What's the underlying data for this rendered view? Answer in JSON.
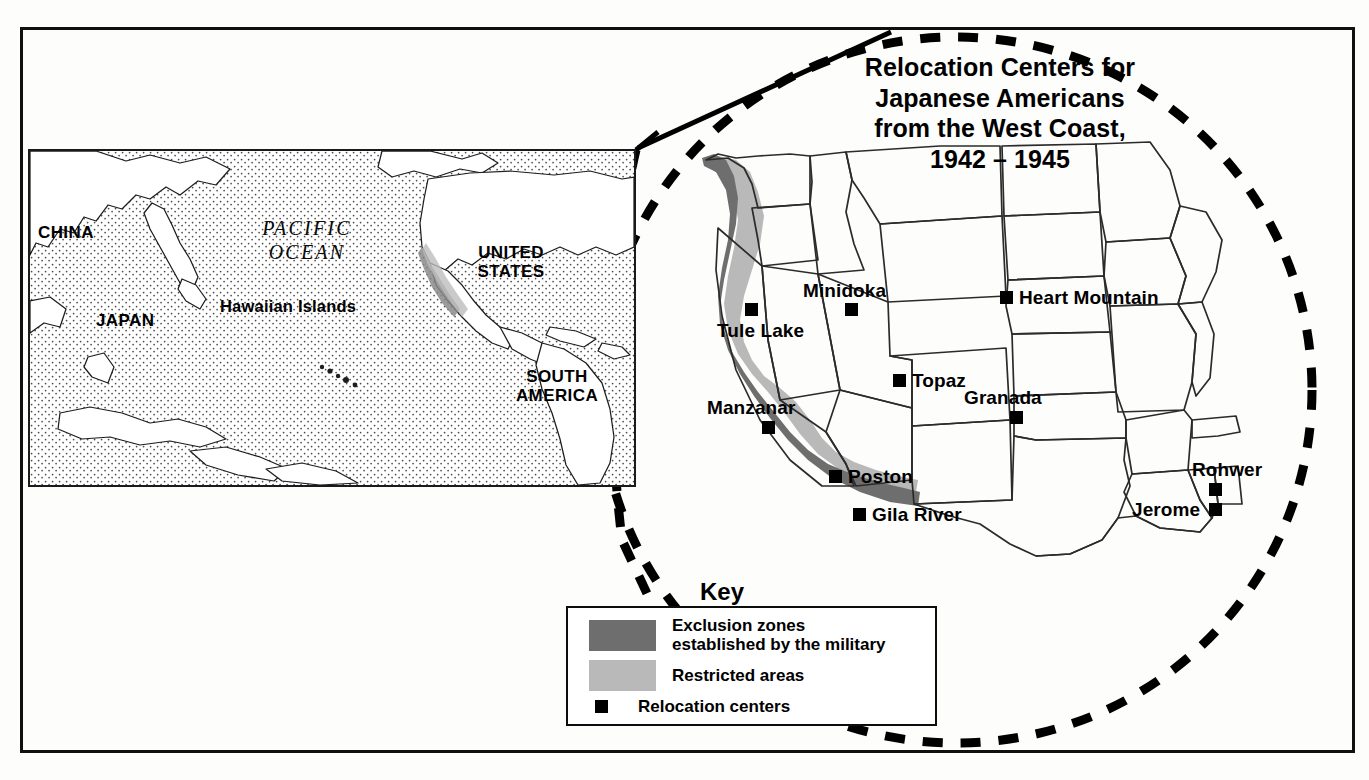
{
  "title": "Relocation Centers for\nJapanese Americans\nfrom the West Coast,\n1942 – 1945",
  "inset": {
    "ocean_label": "PACIFIC\nOCEAN",
    "labels": [
      {
        "name": "china",
        "text": "CHINA"
      },
      {
        "name": "japan",
        "text": "JAPAN"
      },
      {
        "name": "hawaiian-islands",
        "text": "Hawaiian Islands"
      },
      {
        "name": "united-states",
        "text": "UNITED\nSTATES"
      },
      {
        "name": "south-america",
        "text": "SOUTH\nAMERICA"
      }
    ]
  },
  "camps": [
    {
      "name": "tule-lake",
      "label": "Tule Lake"
    },
    {
      "name": "minidoka",
      "label": "Minidoka"
    },
    {
      "name": "heart-mountain",
      "label": "Heart Mountain"
    },
    {
      "name": "topaz",
      "label": "Topaz"
    },
    {
      "name": "granada",
      "label": "Granada"
    },
    {
      "name": "manzanar",
      "label": "Manzanar"
    },
    {
      "name": "poston",
      "label": "Poston"
    },
    {
      "name": "gila-river",
      "label": "Gila River"
    },
    {
      "name": "rohwer",
      "label": "Rohwer"
    },
    {
      "name": "jerome",
      "label": "Jerome"
    }
  ],
  "key": {
    "heading": "Key",
    "items": [
      {
        "name": "exclusion-zones",
        "text": "Exclusion zones\nestablished by the military",
        "swatch": "#6e6e6e"
      },
      {
        "name": "restricted-areas",
        "text": "Restricted areas",
        "swatch": "#b9b9b9"
      },
      {
        "name": "relocation-centers",
        "text": "Relocation centers",
        "swatch": "#000000"
      }
    ]
  },
  "colors": {
    "exclusion": "#6e6e6e",
    "restricted": "#b9b9b9",
    "ink": "#000000",
    "state_line": "#2b2b2b"
  }
}
